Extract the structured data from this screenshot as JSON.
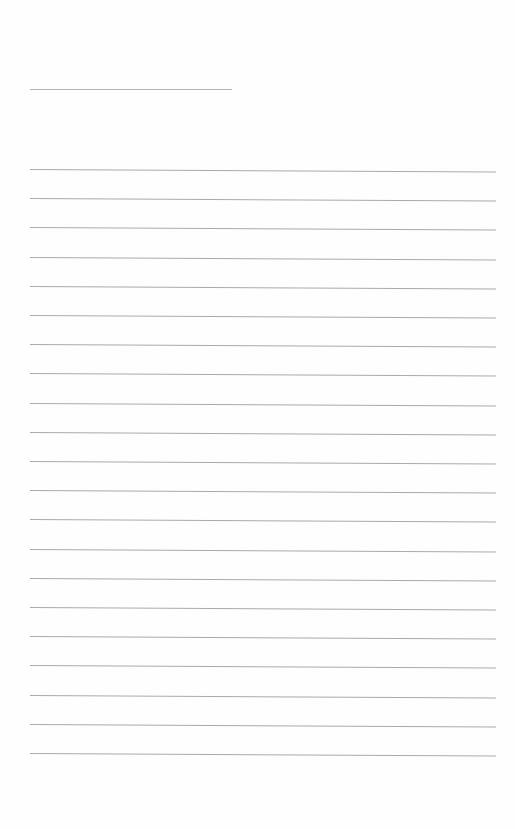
{
  "document": {
    "type": "lined-paper",
    "header_field": {
      "label": "",
      "value": ""
    },
    "lines": [
      {
        "text": ""
      },
      {
        "text": ""
      },
      {
        "text": ""
      },
      {
        "text": ""
      },
      {
        "text": ""
      },
      {
        "text": ""
      },
      {
        "text": ""
      },
      {
        "text": ""
      },
      {
        "text": ""
      },
      {
        "text": ""
      },
      {
        "text": ""
      },
      {
        "text": ""
      },
      {
        "text": ""
      },
      {
        "text": ""
      },
      {
        "text": ""
      },
      {
        "text": ""
      },
      {
        "text": ""
      },
      {
        "text": ""
      },
      {
        "text": ""
      },
      {
        "text": ""
      },
      {
        "text": ""
      }
    ]
  }
}
